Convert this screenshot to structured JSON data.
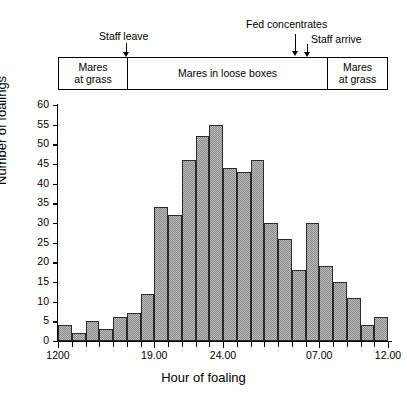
{
  "figure": {
    "axis_x_label": "Hour of foaling",
    "axis_y_label": "Number of foalings"
  },
  "annotations": [
    {
      "name": "staff-leave",
      "label": "Staff leave"
    },
    {
      "name": "fed-concentrates",
      "label": "Fed concentrates"
    },
    {
      "name": "staff-arrive",
      "label": "Staff arrive"
    }
  ],
  "management_band": {
    "segments": [
      {
        "name": "mares-at-grass-left",
        "line1": "Mares",
        "line2": "at grass"
      },
      {
        "name": "mares-in-loose-boxes",
        "line1": "Mares in loose boxes",
        "line2": ""
      },
      {
        "name": "mares-at-grass-right",
        "line1": "Mares",
        "line2": "at grass"
      }
    ]
  },
  "chart_data": {
    "type": "bar",
    "title": "",
    "xlabel": "Hour of foaling",
    "ylabel": "Number of foalings",
    "ylim": [
      0,
      60
    ],
    "ytick_values": [
      0,
      5,
      10,
      15,
      20,
      25,
      30,
      35,
      40,
      45,
      50,
      55,
      60
    ],
    "ytick_labels": [
      "0",
      "5",
      "10",
      "15",
      "20",
      "25",
      "30",
      "35",
      "40",
      "45",
      "50",
      "55",
      "60"
    ],
    "grid": false,
    "legend": null,
    "xtick_labels": [
      "1200",
      "19.00",
      "24.00",
      "07.00",
      "12.00"
    ],
    "xtick_bin_index": [
      0,
      7,
      12,
      19,
      24
    ],
    "bin_width_hours": 1,
    "categories": [
      "12.00",
      "13.00",
      "14.00",
      "15.00",
      "16.00",
      "17.00",
      "18.00",
      "19.00",
      "20.00",
      "21.00",
      "22.00",
      "23.00",
      "24.00",
      "01.00",
      "02.00",
      "03.00",
      "04.00",
      "05.00",
      "06.00",
      "07.00",
      "08.00",
      "09.00",
      "10.00",
      "11.00"
    ],
    "values": [
      4,
      2,
      5,
      3,
      6,
      7,
      12,
      34,
      32,
      46,
      52,
      55,
      44,
      43,
      46,
      30,
      26,
      18,
      30,
      19,
      15,
      11,
      4,
      6
    ],
    "bar_fill_color": "#b9b9b9",
    "bar_edge_color": "#2b2b2b",
    "axis_color": "#000000"
  }
}
